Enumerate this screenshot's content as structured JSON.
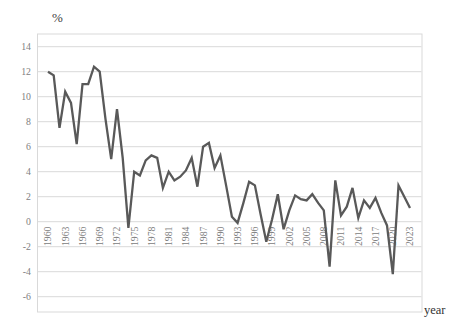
{
  "chart_data": {
    "type": "line",
    "title": "",
    "ylabel": "%",
    "xlabel": "year",
    "ylim": [
      -6,
      14
    ],
    "grid": true,
    "legend": false,
    "line_color": "#595959",
    "grid_color": "#d9d9d9",
    "border_color": "#d9d9d9",
    "tick_color": "#808080",
    "y_tick_labels": [
      "14",
      "12",
      "10",
      "8",
      "6",
      "4",
      "2",
      "0",
      "-2",
      "-4",
      "-6"
    ],
    "x_tick_labels": [
      "1960",
      "1963",
      "1966",
      "1969",
      "1972",
      "1975",
      "1978",
      "1981",
      "1984",
      "1987",
      "1990",
      "1993",
      "1996",
      "1999",
      "2002",
      "2005",
      "2008",
      "2011",
      "2014",
      "2017",
      "2020",
      "2023"
    ],
    "x": [
      1960,
      1961,
      1962,
      1963,
      1964,
      1965,
      1966,
      1967,
      1968,
      1969,
      1970,
      1971,
      1972,
      1973,
      1974,
      1975,
      1976,
      1977,
      1978,
      1979,
      1980,
      1981,
      1982,
      1983,
      1984,
      1985,
      1986,
      1987,
      1988,
      1989,
      1990,
      1991,
      1992,
      1993,
      1994,
      1995,
      1996,
      1997,
      1998,
      1999,
      2000,
      2001,
      2002,
      2003,
      2004,
      2005,
      2006,
      2007,
      2008,
      2009,
      2010,
      2011,
      2012,
      2013,
      2014,
      2015,
      2016,
      2017,
      2018,
      2019,
      2020,
      2021,
      2022,
      2023
    ],
    "values": [
      12.0,
      11.7,
      7.5,
      10.4,
      9.5,
      6.2,
      11.0,
      11.0,
      12.4,
      12.0,
      8.2,
      5.0,
      9.0,
      5.1,
      -0.5,
      4.0,
      3.7,
      4.9,
      5.3,
      5.1,
      2.7,
      4.0,
      3.3,
      3.6,
      4.1,
      5.1,
      2.8,
      6.0,
      6.3,
      4.3,
      5.3,
      2.9,
      0.4,
      -0.1,
      1.5,
      3.2,
      2.9,
      0.6,
      -1.6,
      0.2,
      2.2,
      -0.6,
      0.9,
      2.1,
      1.8,
      1.7,
      2.2,
      1.5,
      0.9,
      -3.6,
      3.3,
      0.5,
      1.2,
      2.7,
      0.3,
      1.7,
      1.1,
      1.9,
      0.7,
      -0.3,
      -4.2,
      2.9,
      2.0,
      1.1
    ]
  }
}
